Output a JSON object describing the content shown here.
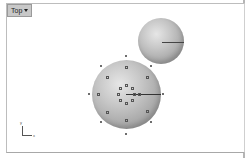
{
  "viewport": {
    "title": "Top",
    "menu_icon": "dropdown-arrow"
  },
  "axes": {
    "x_label": "x",
    "y_label": "y"
  },
  "colors": {
    "background": "#ffffff",
    "tab": "#c8c8c8",
    "sphere": "#b0b0b0"
  }
}
